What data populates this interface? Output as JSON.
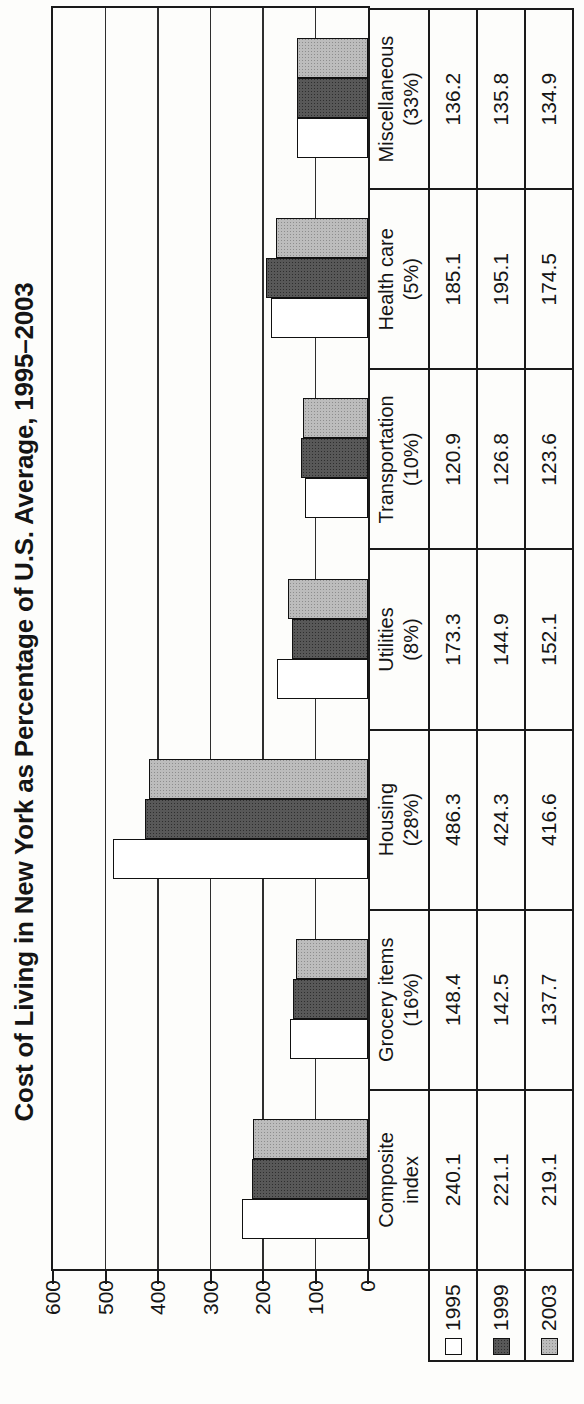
{
  "figure_note": "scanned figure printed rotated 90 degrees counterclockwise on a portrait page",
  "chart_data": {
    "type": "bar",
    "title": "Cost of Living in New York as Percentage of U.S. Average, 1995–2003",
    "categories": [
      {
        "line1": "Composite",
        "line2": "index"
      },
      {
        "line1": "Grocery items",
        "line2": "(16%)"
      },
      {
        "line1": "Housing",
        "line2": "(28%)"
      },
      {
        "line1": "Utilities",
        "line2": "(8%)"
      },
      {
        "line1": "Transportation",
        "line2": "(10%)"
      },
      {
        "line1": "Health care",
        "line2": "(5%)"
      },
      {
        "line1": "Miscellaneous",
        "line2": "(33%)"
      }
    ],
    "series": [
      {
        "name": "1995",
        "swatch": "white",
        "values": [
          240.1,
          148.4,
          486.3,
          173.3,
          120.9,
          185.1,
          136.2
        ]
      },
      {
        "name": "1999",
        "swatch": "dark-gray-halftone",
        "values": [
          221.1,
          142.5,
          424.3,
          144.9,
          126.8,
          195.1,
          135.8
        ]
      },
      {
        "name": "2003",
        "swatch": "light-gray-halftone",
        "values": [
          219.1,
          137.7,
          416.6,
          152.1,
          123.6,
          174.5,
          134.9
        ]
      }
    ],
    "ylim": [
      0,
      600
    ],
    "yticks": [
      600,
      500,
      400,
      300,
      200,
      100,
      0
    ],
    "grid": true,
    "legend_position": "row headers at bottom-left of value table",
    "value_table": true,
    "colors": {
      "bar_1995": "#ffffff",
      "bar_1999": "#585858",
      "bar_2003": "#bcbcbc",
      "line": "#1a1a1a",
      "page": "#fdfdfb"
    }
  }
}
